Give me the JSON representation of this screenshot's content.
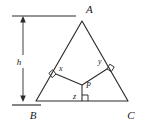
{
  "figure": {
    "type": "geometry-diagram",
    "colors": {
      "stroke": "#2b2b2b",
      "dimension_stroke": "#2b2b2b",
      "label": "#1a1a1a",
      "background": "#ffffff"
    },
    "vertices": [
      {
        "name": "A",
        "label": "A",
        "x": 82,
        "y": 21,
        "label_x": 86,
        "label_y": 13
      },
      {
        "name": "B",
        "label": "B",
        "x": 36,
        "y": 101,
        "label_x": 33,
        "label_y": 119
      },
      {
        "name": "C",
        "label": "C",
        "x": 128,
        "y": 101,
        "label_x": 130,
        "label_y": 119
      }
    ],
    "interior_point": {
      "name": "P",
      "label": "P",
      "x": 82,
      "y": 85,
      "label_x": 86,
      "label_y": 87
    },
    "perpendiculars": [
      {
        "name": "x",
        "label": "x",
        "to_side": "AB",
        "foot_x": 56,
        "foot_y": 74,
        "label_x": 59,
        "label_y": 70,
        "right_angle_at_foot": true
      },
      {
        "name": "y",
        "label": "y",
        "to_side": "AC",
        "foot_x": 107,
        "foot_y": 69,
        "label_x": 99,
        "label_y": 63,
        "right_angle_at_foot": true
      },
      {
        "name": "z",
        "label": "z",
        "to_side": "BC",
        "foot_x": 82,
        "foot_y": 101,
        "label_x": 73,
        "label_y": 98,
        "right_angle_at_foot": true
      }
    ],
    "dimension": {
      "name": "h",
      "label": "h",
      "label_x": 18,
      "label_y": 62,
      "line_x": 23,
      "top_y": 16,
      "bottom_y": 101,
      "extension_top": {
        "x1": 12,
        "x2": 76,
        "y": 16
      },
      "extension_bottom": {
        "x1": 12,
        "x2": 41,
        "y": 105
      },
      "arrowheads": "both"
    }
  }
}
